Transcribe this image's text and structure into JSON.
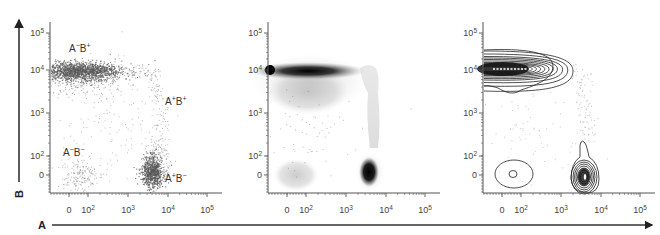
{
  "chart_data": {
    "type": "scatter",
    "title": "",
    "xlabel": "A",
    "ylabel": "B",
    "x_scale": "biexponential",
    "y_scale": "biexponential",
    "x_ticks": [
      "0",
      "10^2",
      "10^3",
      "10^4",
      "10^5"
    ],
    "y_ticks": [
      "0",
      "10^2",
      "10^3",
      "10^4",
      "10^5"
    ],
    "grid": false,
    "legend": null,
    "panels": [
      {
        "name": "dot-plot",
        "style": "dots"
      },
      {
        "name": "density-plot",
        "style": "density"
      },
      {
        "name": "contour-plot",
        "style": "contour"
      }
    ],
    "populations": [
      {
        "label": "A-B+",
        "a_center": "~50",
        "b_center": "~1e4",
        "relative_size": "large",
        "shape": "horizontal band from <0 to ~3e2 in A"
      },
      {
        "label": "A+B+",
        "a_center": "~3e3",
        "b_center": "1e2 to 1e4",
        "relative_size": "sparse",
        "shape": "vertical streak"
      },
      {
        "label": "A-B-",
        "a_center": "~50",
        "b_center": "~0",
        "relative_size": "small",
        "shape": "diffuse cloud"
      },
      {
        "label": "A+B-",
        "a_center": "~3.5e3",
        "b_center": "~0",
        "relative_size": "large",
        "shape": "compact elliptical cluster"
      }
    ]
  },
  "axes": {
    "x_letter": "A",
    "y_letter": "B",
    "tick_labels": {
      "x": [
        {
          "base": "0",
          "exp": ""
        },
        {
          "base": "10",
          "exp": "2"
        },
        {
          "base": "10",
          "exp": "3"
        },
        {
          "base": "10",
          "exp": "4"
        },
        {
          "base": "10",
          "exp": "5"
        }
      ],
      "y": [
        {
          "base": "10",
          "exp": "5"
        },
        {
          "base": "10",
          "exp": "4"
        },
        {
          "base": "10",
          "exp": "3"
        },
        {
          "base": "10",
          "exp": "2"
        },
        {
          "base": "0",
          "exp": ""
        }
      ]
    }
  },
  "quadrant_labels": [
    {
      "a": "A",
      "a_sign": "−",
      "b": "B",
      "b_sign": "+"
    },
    {
      "a": "A",
      "a_sign": "+",
      "b": "B",
      "b_sign": "+"
    },
    {
      "a": "A",
      "a_sign": "−",
      "b": "B",
      "b_sign": "−"
    },
    {
      "a": "A",
      "a_sign": "+",
      "b": "B",
      "b_sign": "−"
    }
  ],
  "colors": {
    "axis": "#555555",
    "arrow": "#222222",
    "dots": "#6a6a6a",
    "dense": "#111111",
    "contour": "#222222"
  }
}
